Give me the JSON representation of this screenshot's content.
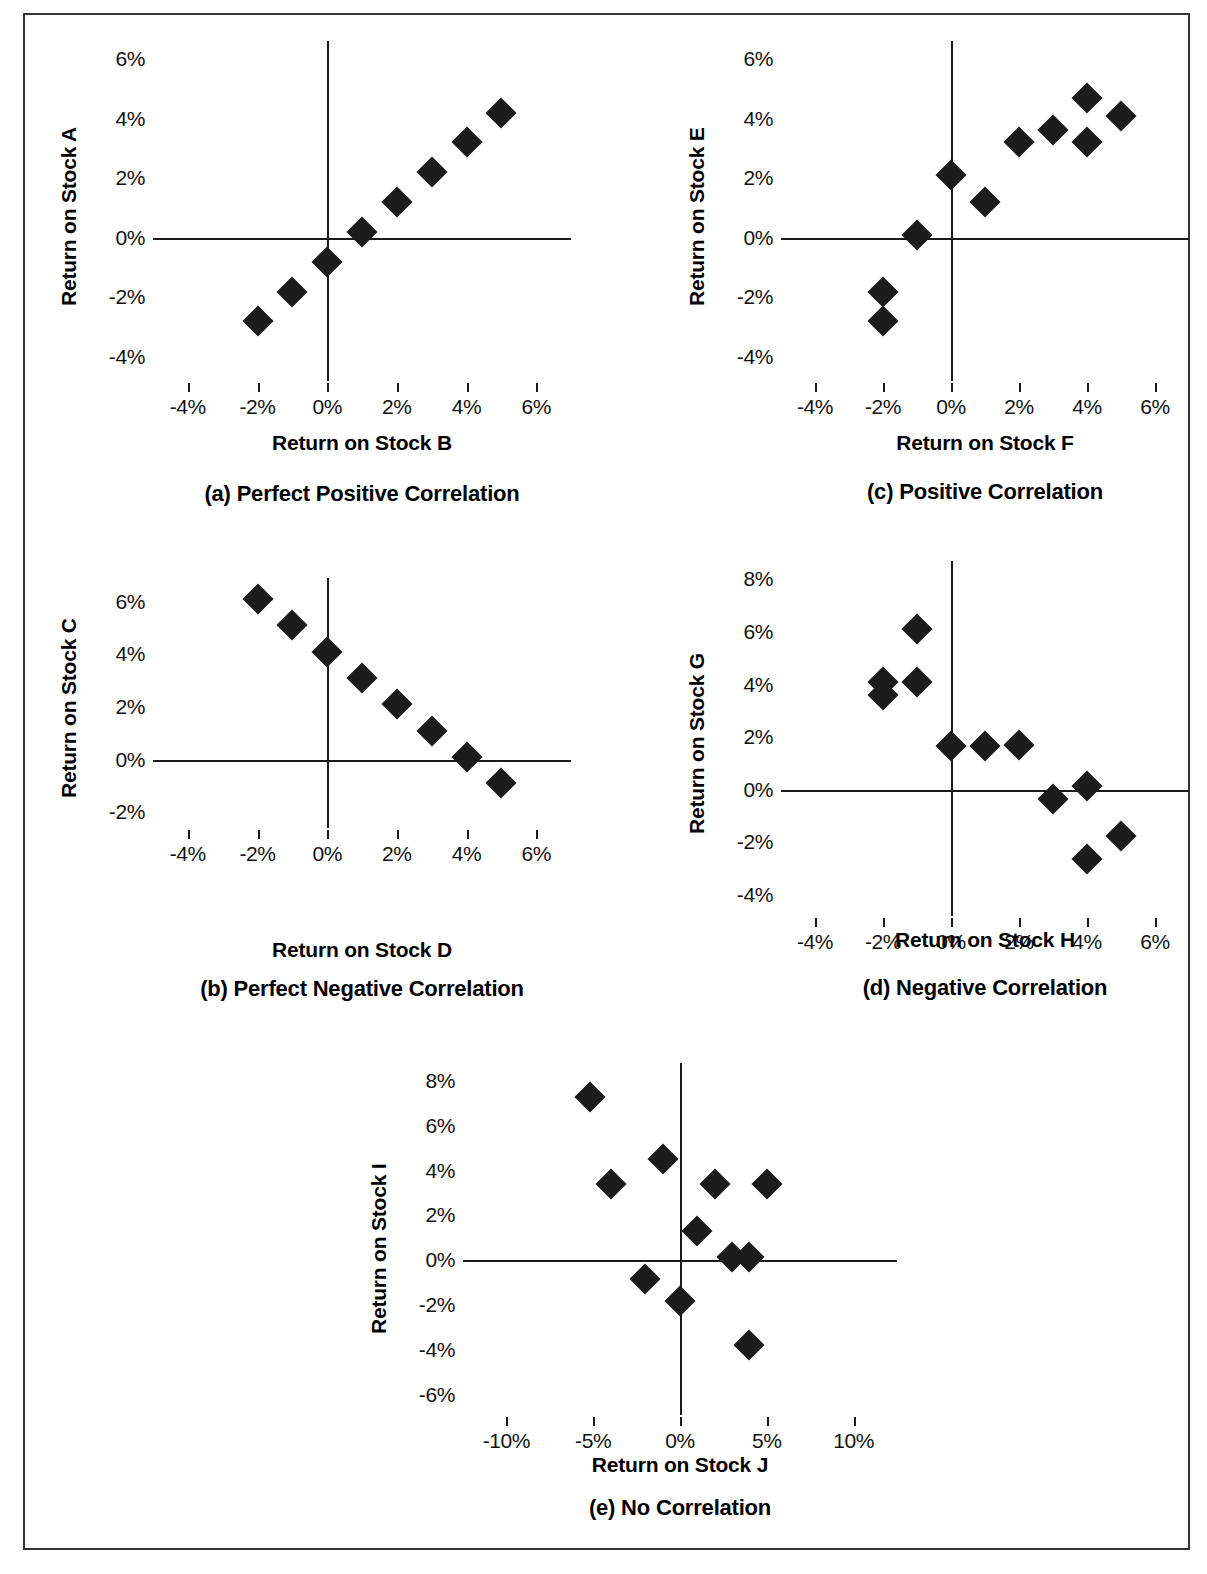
{
  "chart_data": [
    {
      "id": "a",
      "type": "scatter",
      "caption": "(a) Perfect Positive Correlation",
      "xlabel": "Return on Stock B",
      "ylabel": "Return on Stock A",
      "xticks": [
        "-4%",
        "-2%",
        "0%",
        "2%",
        "4%",
        "6%"
      ],
      "xtickvals": [
        -4,
        -2,
        0,
        2,
        4,
        6
      ],
      "yticks": [
        "6%",
        "4%",
        "2%",
        "0%",
        "-2%",
        "-4%"
      ],
      "ytickvals": [
        6,
        4,
        2,
        0,
        -2,
        -4
      ],
      "xlim": [
        -5,
        7
      ],
      "ylim": [
        -4.8,
        6.6
      ],
      "grid": false,
      "legend": "none",
      "points": [
        {
          "x": -2,
          "y": -2.8
        },
        {
          "x": -1,
          "y": -1.8
        },
        {
          "x": 0,
          "y": -0.8
        },
        {
          "x": 1,
          "y": 0.2
        },
        {
          "x": 2,
          "y": 1.2
        },
        {
          "x": 3,
          "y": 2.2
        },
        {
          "x": 4,
          "y": 3.2
        },
        {
          "x": 5,
          "y": 4.2
        }
      ]
    },
    {
      "id": "c",
      "type": "scatter",
      "caption": "(c) Positive Correlation",
      "xlabel": "Return on Stock F",
      "ylabel": "Return on Stock E",
      "xticks": [
        "-4%",
        "-2%",
        "0%",
        "2%",
        "4%",
        "6%"
      ],
      "xtickvals": [
        -4,
        -2,
        0,
        2,
        4,
        6
      ],
      "yticks": [
        "6%",
        "4%",
        "2%",
        "0%",
        "-2%",
        "-4%"
      ],
      "ytickvals": [
        6,
        4,
        2,
        0,
        -2,
        -4
      ],
      "xlim": [
        -5,
        7
      ],
      "ylim": [
        -4.8,
        6.6
      ],
      "grid": false,
      "legend": "none",
      "points": [
        {
          "x": -2,
          "y": -2.8
        },
        {
          "x": -2,
          "y": -1.8
        },
        {
          "x": -1,
          "y": 0.1
        },
        {
          "x": 0,
          "y": 2.1
        },
        {
          "x": 1,
          "y": 1.2
        },
        {
          "x": 2,
          "y": 3.2
        },
        {
          "x": 3,
          "y": 3.6
        },
        {
          "x": 4,
          "y": 4.7
        },
        {
          "x": 4,
          "y": 3.2
        },
        {
          "x": 5,
          "y": 4.1
        }
      ]
    },
    {
      "id": "b",
      "type": "scatter",
      "caption": "(b) Perfect Negative Correlation",
      "xlabel": "Return on Stock D",
      "ylabel": "Return on Stock C",
      "xticks": [
        "-4%",
        "-2%",
        "0%",
        "2%",
        "4%",
        "6%"
      ],
      "xtickvals": [
        -4,
        -2,
        0,
        2,
        4,
        6
      ],
      "yticks": [
        "6%",
        "4%",
        "2%",
        "0%",
        "-2%"
      ],
      "ytickvals": [
        6,
        4,
        2,
        0,
        -2
      ],
      "xlim": [
        -5,
        7
      ],
      "ylim": [
        -2.6,
        6.9
      ],
      "grid": false,
      "legend": "none",
      "points": [
        {
          "x": -2,
          "y": 6.1
        },
        {
          "x": -1,
          "y": 5.1
        },
        {
          "x": 0,
          "y": 4.1
        },
        {
          "x": 1,
          "y": 3.1
        },
        {
          "x": 2,
          "y": 2.1
        },
        {
          "x": 3,
          "y": 1.1
        },
        {
          "x": 4,
          "y": 0.1
        },
        {
          "x": 5,
          "y": -0.9
        }
      ]
    },
    {
      "id": "d",
      "type": "scatter",
      "caption": "(d) Negative Correlation",
      "xlabel": "Return on Stock H",
      "ylabel": "Return on Stock G",
      "xticks": [
        "-4%",
        "-2%",
        "0%",
        "2%",
        "4%",
        "6%"
      ],
      "xtickvals": [
        -4,
        -2,
        0,
        2,
        4,
        6
      ],
      "yticks": [
        "8%",
        "6%",
        "4%",
        "2%",
        "0%",
        "-2%",
        "-4%"
      ],
      "ytickvals": [
        8,
        6,
        4,
        2,
        0,
        -2,
        -4
      ],
      "xlim": [
        -5,
        7
      ],
      "ylim": [
        -4.8,
        8.7
      ],
      "grid": false,
      "legend": "none",
      "points": [
        {
          "x": -2,
          "y": 4.1
        },
        {
          "x": -2,
          "y": 3.6
        },
        {
          "x": -1,
          "y": 6.1
        },
        {
          "x": -1,
          "y": 4.1
        },
        {
          "x": 0,
          "y": 1.65
        },
        {
          "x": 1,
          "y": 1.65
        },
        {
          "x": 2,
          "y": 1.7
        },
        {
          "x": 3,
          "y": -0.35
        },
        {
          "x": 4,
          "y": 0.15
        },
        {
          "x": 4,
          "y": -2.65
        },
        {
          "x": 5,
          "y": -1.75
        }
      ]
    },
    {
      "id": "e",
      "type": "scatter",
      "caption": "(e) No Correlation",
      "xlabel": "Return on Stock J",
      "ylabel": "Return on Stock I",
      "xticks": [
        "-10%",
        "-5%",
        "0%",
        "5%",
        "10%"
      ],
      "xtickvals": [
        -10,
        -5,
        0,
        5,
        10
      ],
      "yticks": [
        "8%",
        "6%",
        "4%",
        "2%",
        "0%",
        "-2%",
        "-4%",
        "-6%"
      ],
      "ytickvals": [
        8,
        6,
        4,
        2,
        0,
        -2,
        -4,
        -6
      ],
      "xlim": [
        -12.5,
        12.5
      ],
      "ylim": [
        -6.9,
        8.8
      ],
      "grid": false,
      "legend": "none",
      "points": [
        {
          "x": -5.2,
          "y": 7.3
        },
        {
          "x": -4,
          "y": 3.4
        },
        {
          "x": -2,
          "y": -0.85
        },
        {
          "x": -1,
          "y": 4.5
        },
        {
          "x": 0,
          "y": -1.8
        },
        {
          "x": 1,
          "y": 1.3
        },
        {
          "x": 2,
          "y": 3.4
        },
        {
          "x": 3,
          "y": 0.15
        },
        {
          "x": 4,
          "y": 0.15
        },
        {
          "x": 4,
          "y": -3.8
        },
        {
          "x": 5,
          "y": 3.4
        }
      ]
    }
  ],
  "layout": {
    "a": {
      "left": 130,
      "top": 28,
      "width": 418,
      "height": 340,
      "xlab_y": 418,
      "cap_y": 468
    },
    "c": {
      "left": 758,
      "top": 28,
      "width": 408,
      "height": 340,
      "xlab_y": 418,
      "cap_y": 466
    },
    "b": {
      "left": 130,
      "top": 565,
      "width": 418,
      "height": 250,
      "xlab_y": 925,
      "cap_y": 963
    },
    "d": {
      "left": 758,
      "top": 548,
      "width": 408,
      "height": 355,
      "xlab_y": 915,
      "cap_y": 962
    },
    "e": {
      "left": 440,
      "top": 1050,
      "width": 434,
      "height": 352,
      "xlab_y": 1440,
      "cap_y": 1482
    }
  },
  "colors": {
    "marker": "#1c1c1c",
    "axis": "#1a1a1a",
    "frame": "#333333",
    "background": "#ffffff",
    "text": "#000000"
  }
}
